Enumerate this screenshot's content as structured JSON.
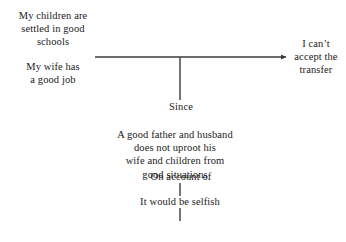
{
  "diagram": {
    "type": "argument-diagram",
    "background_color": "#ffffff",
    "line_color": "#3a3a3a",
    "text_color": "#1a1a1a",
    "nodes": {
      "reason_children": "My children are\nsettled in good\nschools",
      "reason_wife": "My wife has\na good job",
      "conclusion": "I can’t\naccept the\ntransfer",
      "warrant": "A good father and husband\ndoes not uproot his\nwife and children from\ngood situations",
      "backing": "It would be selfish"
    },
    "connector_labels": {
      "since": "Since",
      "on_account_of": "On account of"
    },
    "edges": [
      {
        "name": "premises-to-conclusion",
        "style": "horizontal-arrow",
        "from_x": 95,
        "to_x": 290,
        "y": 57,
        "arrowhead": "right"
      },
      {
        "name": "conclusion-to-warrant",
        "style": "vertical-line",
        "x": 180,
        "from_y": 57,
        "to_y": 100
      },
      {
        "name": "warrant-to-backing-upper",
        "style": "vertical-line",
        "x": 180,
        "from_y": 183,
        "to_y": 196
      },
      {
        "name": "backing-connector-lower",
        "style": "vertical-line",
        "x": 180,
        "from_y": 208,
        "to_y": 221
      }
    ]
  }
}
